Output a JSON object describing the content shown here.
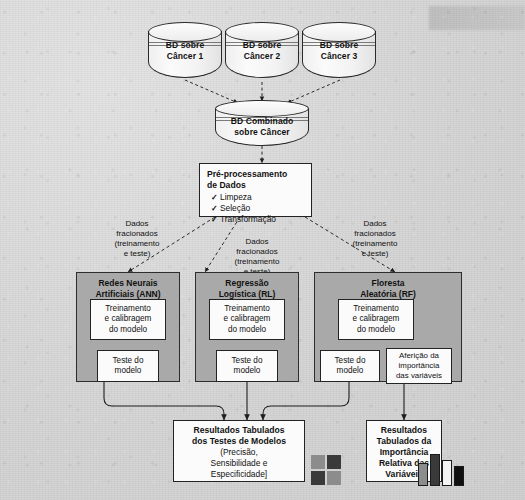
{
  "diagram": {
    "databases": [
      {
        "id": "db1",
        "label_line1": "BD sobre",
        "label_line2": "Câncer 1"
      },
      {
        "id": "db2",
        "label_line1": "BD sobre",
        "label_line2": "Câncer 2"
      },
      {
        "id": "db3",
        "label_line1": "BD sobre",
        "label_line2": "Câncer 3"
      }
    ],
    "combined_db": {
      "label_line1": "BD Combinado",
      "label_line2": "sobre Câncer"
    },
    "preprocessing": {
      "title_line1": "Pré-processamento",
      "title_line2": "de Dados",
      "check_mark": "✓",
      "items": [
        "Limpeza",
        "Seleção",
        "Transformação"
      ]
    },
    "split_labels": [
      {
        "id": "split-left",
        "text": "Dados\nfracionados\n(treinamento\ne teste)"
      },
      {
        "id": "split-center",
        "text": "Dados\nfracionados\n(treinamento\ne teste)"
      },
      {
        "id": "split-right",
        "text": "Dados\nfracionados\n(treinamento\ne teste)"
      }
    ],
    "models": [
      {
        "id": "ann",
        "title_line1": "Redes Neurais",
        "title_line2": "Artificiais (ANN)",
        "steps": [
          {
            "id": "ann-train",
            "text": "Treinamento\ne calibragem\ndo modelo"
          },
          {
            "id": "ann-test",
            "text": "Teste do\nmodelo"
          }
        ]
      },
      {
        "id": "rl",
        "title_line1": "Regressão",
        "title_line2": "Logística (RL)",
        "steps": [
          {
            "id": "rl-train",
            "text": "Treinamento\ne calibragem\ndo modelo"
          },
          {
            "id": "rl-test",
            "text": "Teste do\nmodelo"
          }
        ]
      },
      {
        "id": "rf",
        "title_line1": "Floresta",
        "title_line2": "Aleatória (RF)",
        "steps": [
          {
            "id": "rf-train",
            "text": "Treinamento\ne calibragem\ndo modelo"
          },
          {
            "id": "rf-test",
            "text": "Teste do\nmodelo"
          },
          {
            "id": "rf-importance",
            "text": "Aferição da\nimportância\ndas variáveis"
          }
        ]
      }
    ],
    "results": [
      {
        "id": "results-models",
        "title": "Resultados Tabulados\ndos Testes de Modelos",
        "subtitle": "(Precisão,\nSensibilidade e\nEspecificidade]",
        "icon": "table-grid-icon"
      },
      {
        "id": "results-importance",
        "title": "Resultados\nTabulados da\nImportância\nRelativa das\nVariáveis",
        "subtitle": "",
        "icon": "bar-chart-icon"
      }
    ],
    "colors": {
      "background": "#d6d6d6",
      "panel_fill": "#a9a9a9",
      "box_fill": "#fbfbfb",
      "stroke": "#232323",
      "icon_gray": "#8c8c8c",
      "icon_dark": "#3a3a3a",
      "icon_black": "#101010",
      "icon_white": "#f4f4f4"
    },
    "icon_bars": [
      {
        "color_key": "icon_gray",
        "height_pct": 62
      },
      {
        "color_key": "icon_dark",
        "height_pct": 88
      },
      {
        "color_key": "icon_white",
        "height_pct": 70
      },
      {
        "color_key": "icon_black",
        "height_pct": 52
      }
    ],
    "icon_cells": [
      "icon_gray",
      "icon_dark",
      "icon_dark",
      "icon_gray"
    ]
  }
}
